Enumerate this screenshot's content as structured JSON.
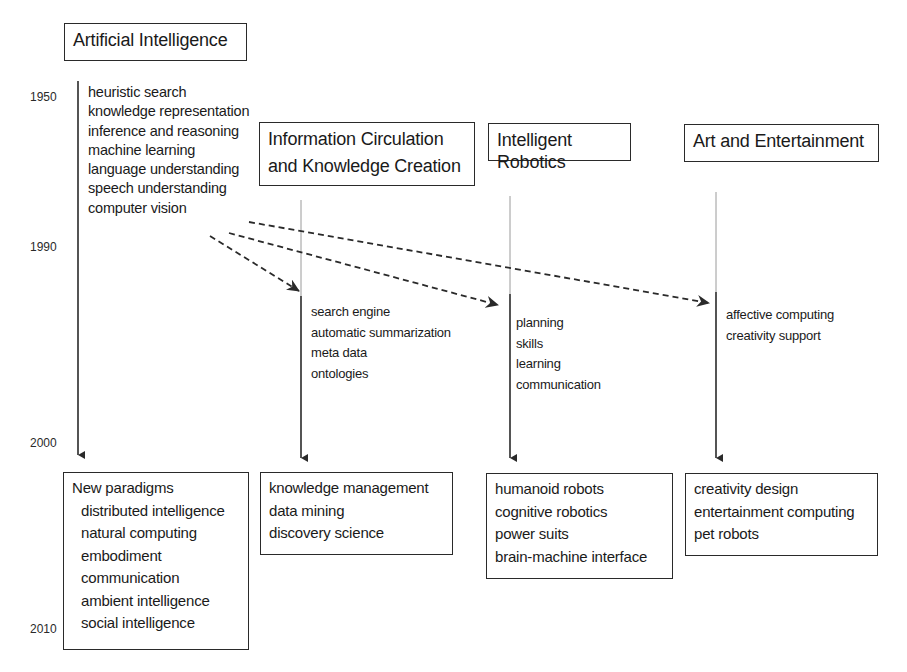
{
  "years": [
    {
      "label": "1950",
      "y": 90
    },
    {
      "label": "1990",
      "y": 240
    },
    {
      "label": "2000",
      "y": 436
    },
    {
      "label": "2010",
      "y": 622
    }
  ],
  "columns": [
    {
      "id": "ai",
      "title": "Artificial Intelligence",
      "early_topics": [
        "heuristic search",
        "knowledge representation",
        "inference and reasoning",
        "machine learning",
        "language understanding",
        "speech understanding",
        "computer vision"
      ],
      "outcome": {
        "heading": "New paradigms",
        "items": [
          "distributed intelligence",
          "natural computing",
          "embodiment",
          "communication",
          "ambient intelligence",
          "social intelligence"
        ]
      }
    },
    {
      "id": "info",
      "title_lines": [
        "Information Circulation",
        "and Knowledge Creation"
      ],
      "mid_topics": [
        "search engine",
        "automatic summarization",
        "meta data",
        "ontologies"
      ],
      "outcome": {
        "items": [
          "knowledge management",
          "data mining",
          "discovery science"
        ]
      }
    },
    {
      "id": "robotics",
      "title": "Intelligent Robotics",
      "mid_topics": [
        "planning",
        "skills",
        "learning",
        "communication"
      ],
      "outcome": {
        "items": [
          "humanoid robots",
          "cognitive robotics",
          "power suits",
          "brain-machine interface"
        ]
      }
    },
    {
      "id": "art",
      "title": "Art and Entertainment",
      "mid_topics": [
        "affective computing",
        "creativity support"
      ],
      "outcome": {
        "items": [
          "creativity design",
          "entertainment computing",
          "pet robots"
        ]
      }
    }
  ],
  "arrows": [
    {
      "from": "ai",
      "to": "info",
      "style": "dashed"
    },
    {
      "from": "ai",
      "to": "robotics",
      "style": "dashed"
    },
    {
      "from": "ai",
      "to": "art",
      "style": "dashed"
    }
  ],
  "colors": {
    "line": "#2a2a2a",
    "faint_line": "#9a9a9a",
    "background": "#ffffff"
  }
}
